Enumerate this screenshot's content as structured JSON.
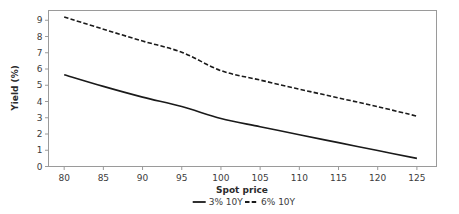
{
  "chart_data": {
    "type": "line",
    "title": "",
    "xlabel": "Spot price",
    "ylabel": "Yield (%)",
    "xlim": [
      78,
      127.5
    ],
    "ylim": [
      0,
      9.6
    ],
    "xticks": [
      80,
      85,
      90,
      95,
      100,
      105,
      110,
      115,
      120,
      125
    ],
    "xtick_labels": [
      "80",
      "85",
      "90",
      "95",
      "100",
      "105",
      "110",
      "115",
      "120",
      "125"
    ],
    "yticks": [
      0,
      1,
      2,
      3,
      4,
      5,
      6,
      7,
      8,
      9
    ],
    "ytick_labels": [
      "0",
      "1",
      "2",
      "3",
      "4",
      "5",
      "6",
      "7",
      "8",
      "9"
    ],
    "grid": false,
    "legend_position": "below-axis-center",
    "legend_orientation": "horizontal",
    "line_color": "#1a1a1a",
    "frame_color": "#9a9a9a",
    "background": "#ffffff",
    "x": [
      80,
      85,
      90,
      95,
      100,
      105,
      110,
      115,
      120,
      125
    ],
    "series": [
      {
        "name": "3% 10Y",
        "style": "solid",
        "color": "#1a1a1a",
        "values": [
          5.65,
          4.93,
          4.27,
          3.69,
          2.95,
          2.45,
          1.95,
          1.47,
          0.98,
          0.5
        ]
      },
      {
        "name": "6% 10Y",
        "style": "dashed",
        "color": "#1a1a1a",
        "values": [
          9.2,
          8.45,
          7.72,
          7.03,
          5.9,
          5.32,
          4.76,
          4.22,
          3.68,
          3.1
        ]
      }
    ]
  },
  "legend": {
    "items": [
      {
        "label": "3% 10Y",
        "style": "solid"
      },
      {
        "label": "6% 10Y",
        "style": "dashed"
      }
    ]
  }
}
